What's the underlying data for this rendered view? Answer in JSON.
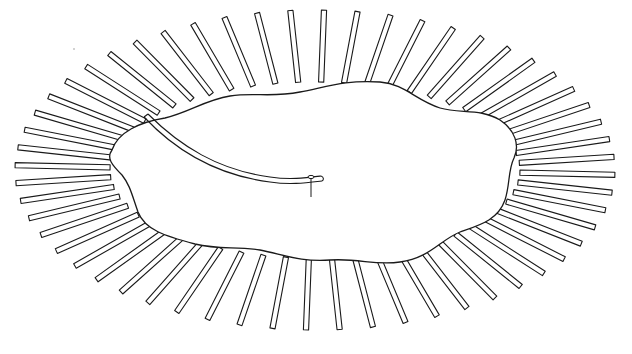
{
  "figure": {
    "stroke_color": "#1a1a1a",
    "background_color": "#ffffff",
    "center": [
      315,
      170
    ],
    "strip_count": 56,
    "inner_rx": 205,
    "inner_ry": 88,
    "outer_rx": 300,
    "outer_ry": 160
  }
}
